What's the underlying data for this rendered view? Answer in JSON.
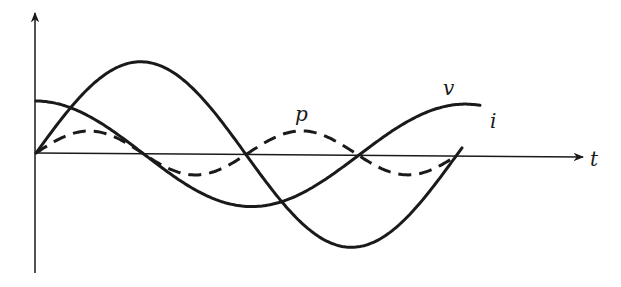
{
  "figure": {
    "colors": {
      "ink": "#1a1a1a",
      "background": "#ffffff"
    },
    "axes": {
      "origin": [
        36,
        153
      ],
      "x_axis_end": 584,
      "y_axis_top": 12,
      "y_axis_bottom": 273,
      "x_label": "t"
    },
    "labels": {
      "v": "v",
      "i": "i",
      "p": "p",
      "t": "t"
    },
    "curves": {
      "v": {
        "name": "v",
        "style": "solid",
        "shape": "sine",
        "amplitude_px": 92,
        "period_px": 420,
        "phase_deg": 0,
        "x_start": 36,
        "x_end": 463
      },
      "i": {
        "name": "i",
        "style": "solid",
        "shape": "cosine",
        "amplitude_px": 52,
        "period_px": 430,
        "phase_deg": 90,
        "x_start": 36,
        "x_end": 481
      },
      "p": {
        "name": "p",
        "style": "dashed",
        "shape": "sine_double_freq",
        "amplitude_px": 22,
        "period_px": 210,
        "x_start": 36,
        "x_end": 455
      }
    }
  }
}
